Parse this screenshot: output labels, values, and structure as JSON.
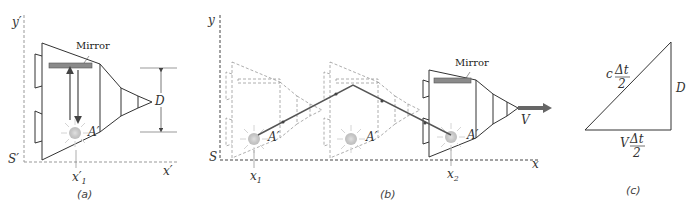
{
  "panels": {
    "a": {
      "caption": "(a)",
      "axis_y": "y′",
      "axis_x": "x′",
      "origin": "S′",
      "position": "x′",
      "position_sub": "1",
      "mirror_label": "Mirror",
      "source_label": "A′",
      "height_label": "D"
    },
    "b": {
      "caption": "(b)",
      "axis_y": "y",
      "axis_x": "x",
      "origin": "S",
      "x1": "x",
      "x1_sub": "1",
      "x2": "x",
      "x2_sub": "2",
      "mirror_label": "Mirror",
      "source_label": "A′",
      "velocity_label": "V"
    },
    "c": {
      "caption": "(c)",
      "hyp_coef": "c",
      "hyp_num": "Δt",
      "hyp_den": "2",
      "base_coef": "V",
      "base_num": "Δt",
      "base_den": "2",
      "side_label": "D"
    }
  },
  "colors": {
    "line": "#333333",
    "dashed": "#888888",
    "mirror": "#8a8a8a",
    "beam": "#555555",
    "glow": "#cfcfcf"
  }
}
